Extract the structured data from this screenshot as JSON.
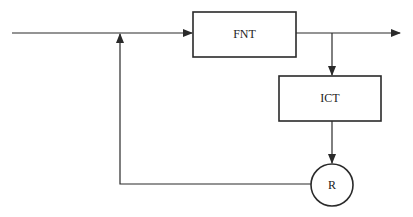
{
  "diagram": {
    "type": "block-diagram-feedback-loop",
    "nodes": [
      {
        "id": "fnt",
        "label": "FNT",
        "shape": "rectangle"
      },
      {
        "id": "ict",
        "label": "ICT",
        "shape": "rectangle"
      },
      {
        "id": "r",
        "label": "R",
        "shape": "circle"
      }
    ],
    "edges": [
      {
        "from": "input",
        "to": "fnt",
        "description": "input line joined by feedback, arrow into FNT"
      },
      {
        "from": "fnt",
        "to": "output",
        "description": "output arrow to the right"
      },
      {
        "from": "fnt",
        "to": "ict",
        "description": "branch from output line down into ICT"
      },
      {
        "from": "ict",
        "to": "r",
        "description": "arrow down into R"
      },
      {
        "from": "r",
        "to": "input",
        "description": "feedback line left then up, arrow into input line"
      }
    ],
    "colors": {
      "stroke": "#2a2a2a",
      "background": "#ffffff"
    }
  }
}
